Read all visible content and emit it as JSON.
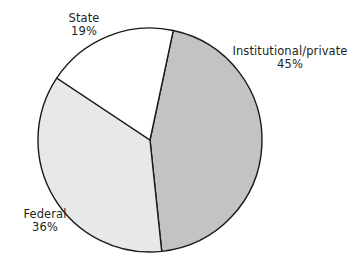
{
  "chart_data": {
    "type": "pie",
    "title": "",
    "subtitle": "",
    "xlabel": "",
    "ylabel": "",
    "legend_position": "none",
    "grid": false,
    "labels_inline": true,
    "categories": [
      "Institutional/private",
      "Federal",
      "State"
    ],
    "values": [
      45,
      36,
      19
    ],
    "value_unit": "%",
    "slices": [
      {
        "label": "Institutional/private",
        "value": 45,
        "value_text": "45%",
        "color": "#c3c3c3",
        "start_angle_deg": 12,
        "end_angle_deg": 174
      },
      {
        "label": "Federal",
        "value": 36,
        "value_text": "36%",
        "color": "#e8e8e8",
        "start_angle_deg": 174,
        "end_angle_deg": 303.6
      },
      {
        "label": "State",
        "value": 19,
        "value_text": "19%",
        "color": "#ffffff",
        "start_angle_deg": 303.6,
        "end_angle_deg": 372
      }
    ],
    "total": 100,
    "geometry": {
      "center_x": 150,
      "center_y": 140,
      "radius": 112,
      "stroke_color": "#1a1a1a",
      "stroke_width": 1.4
    }
  },
  "labels": {
    "state": {
      "name": "State",
      "value": "19%"
    },
    "institutional": {
      "name": "Institutional/private",
      "value": "45%"
    },
    "federal": {
      "name": "Federal",
      "value": "36%"
    }
  },
  "colors": {
    "background": "#ffffff",
    "text": "#231f20",
    "outline": "#1a1a1a",
    "slice_institutional": "#c3c3c3",
    "slice_federal": "#e8e8e8",
    "slice_state": "#ffffff"
  }
}
